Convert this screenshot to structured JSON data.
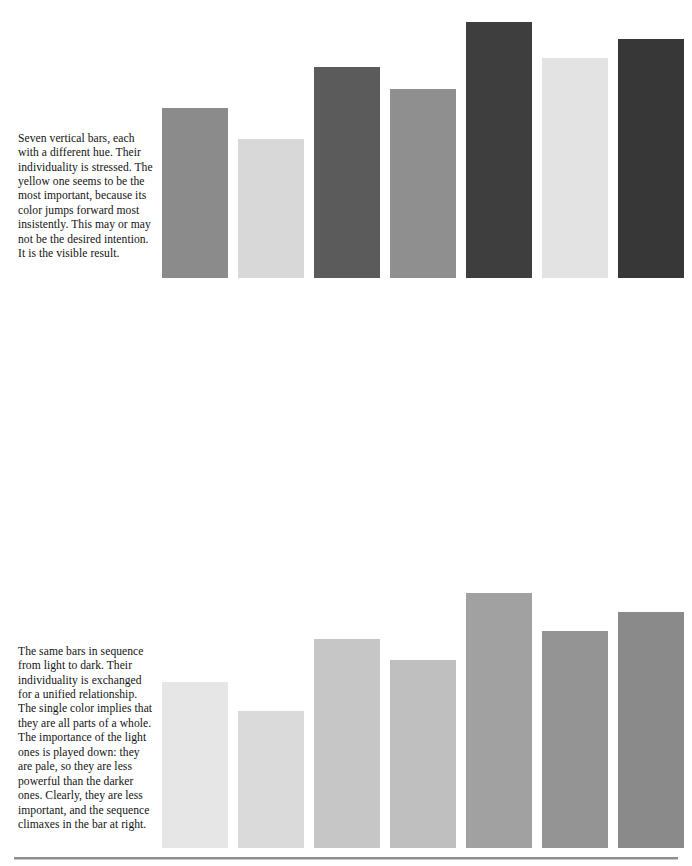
{
  "page": {
    "background_color": "#ffffff",
    "footer_rule_color": "#8d8d8d"
  },
  "captions": [
    {
      "id": "caption-hue",
      "text": "Seven vertical bars, each with a different hue. Their individuality is stressed. The yellow one seems to be the most important, because its color jumps forward most insistently. This may or may not be the desired intention. It is the visible result."
    },
    {
      "id": "caption-light-to-dark",
      "text": "The same bars in sequence from light to dark. Their individuality is exchanged for a unified relationship. The single color implies that they are all parts of a whole. The importance of the light ones is played down: they are pale, so they are less powerful than the darker ones. Clearly, they are less important, and the sequence climaxes in the bar at right."
    },
    {
      "id": "caption-dark-to-light",
      "text": "The monochromatic arrangement is shown in reverse pattern, from dark to light. Here the bars at left are the important ones, and the ones at right look as if they were tapering off to insignificance."
    }
  ],
  "chart_data": [
    {
      "type": "bar",
      "id": "chart-different-hues",
      "title": "Seven vertical bars, each with a different hue",
      "xlabel": "",
      "ylabel": "",
      "grid": false,
      "legend": "none",
      "orientation": "vertical",
      "categories": [
        "1",
        "2",
        "3",
        "4",
        "5",
        "6",
        "7"
      ],
      "values": [
        61,
        50,
        76,
        68,
        92,
        79,
        86
      ],
      "ylim": [
        0,
        100
      ],
      "colors": [
        "#8b8b8b",
        "#d8d8d8",
        "#5b5b5b",
        "#8f8f8f",
        "#3e3e3e",
        "#e3e3e3",
        "#373737"
      ],
      "color_names": [
        "mid-gray",
        "pale-gray",
        "dark-gray",
        "mid-gray",
        "very-dark-gray",
        "lightest-gray",
        "near-black"
      ]
    },
    {
      "type": "bar",
      "id": "chart-light-to-dark",
      "title": "The same bars in sequence from light to dark",
      "xlabel": "",
      "ylabel": "",
      "grid": false,
      "legend": "none",
      "orientation": "vertical",
      "categories": [
        "1",
        "2",
        "3",
        "4",
        "5",
        "6",
        "7"
      ],
      "values": [
        62,
        51,
        78,
        70,
        95,
        81,
        88
      ],
      "ylim": [
        0,
        100
      ],
      "colors": [
        "#e6e6e6",
        "#dadada",
        "#c6c6c6",
        "#bfbfbf",
        "#a1a1a1",
        "#949494",
        "#8a8a8a"
      ],
      "color_names": [
        "lightest",
        "lighter",
        "light",
        "light-mid",
        "mid",
        "mid-dark",
        "darkest"
      ]
    },
    {
      "type": "bar",
      "id": "chart-dark-to-light",
      "title": "The monochromatic arrangement in reverse pattern, from dark to light",
      "xlabel": "",
      "ylabel": "",
      "grid": false,
      "legend": "none",
      "orientation": "vertical",
      "categories": [
        "1",
        "2",
        "3",
        "4",
        "5",
        "6",
        "7"
      ],
      "values": [
        62,
        51,
        78,
        70,
        95,
        81,
        88
      ],
      "ylim": [
        0,
        100
      ],
      "colors": [
        "#7b7b7b",
        "#8f8f8f",
        "#9d9d9d",
        "#b2b2b2",
        "#b8b8b8",
        "#cfcfcf",
        "#e2e2e2"
      ],
      "color_names": [
        "darkest",
        "dark",
        "mid-dark",
        "mid",
        "mid-light",
        "light",
        "lightest"
      ]
    }
  ]
}
